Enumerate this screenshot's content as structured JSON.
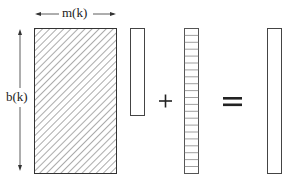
{
  "diagram": {
    "width_label": "m(k)",
    "height_label": "b(k)",
    "plus_symbol": "+",
    "equals_symbol": "=",
    "elements": [
      {
        "name": "hatched-matrix",
        "description": "matrix with diagonal hatching"
      },
      {
        "name": "vector",
        "description": "plain column vector"
      },
      {
        "name": "striped-vector",
        "description": "column vector with horizontal stripes"
      },
      {
        "name": "result-vector",
        "description": "plain result column vector"
      }
    ],
    "colors": {
      "stroke": "#333333",
      "background": "#ffffff"
    }
  }
}
